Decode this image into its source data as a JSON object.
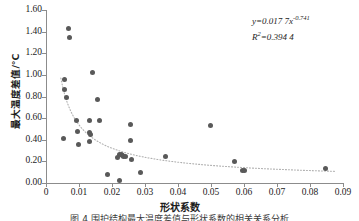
{
  "chart_data": {
    "type": "scatter",
    "title": "",
    "xlabel": "形状系数",
    "ylabel": "最大温度差值/°C",
    "xlim": [
      0,
      0.09
    ],
    "ylim": [
      0,
      1.6
    ],
    "xticks": [
      "0",
      "0.01",
      "0.02",
      "0.03",
      "0.04",
      "0.05",
      "0.06",
      "0.07",
      "0.08",
      "0.09"
    ],
    "xtick_values": [
      0,
      0.01,
      0.02,
      0.03,
      0.04,
      0.05,
      0.06,
      0.07,
      0.08,
      0.09
    ],
    "yticks": [
      "0.00",
      "0.20",
      "0.40",
      "0.60",
      "0.80",
      "1.00",
      "1.20",
      "1.40",
      "1.60"
    ],
    "ytick_values": [
      0,
      0.2,
      0.4,
      0.6,
      0.8,
      1.0,
      1.2,
      1.4,
      1.6
    ],
    "grid": false,
    "legend": "none",
    "marker_color": "#595959",
    "trendline_color": "#b0b0b0",
    "trendline_style": "dotted",
    "points": [
      [
        0.0068,
        1.425
      ],
      [
        0.007,
        1.345
      ],
      [
        0.0055,
        0.96
      ],
      [
        0.0057,
        0.868
      ],
      [
        0.0062,
        0.795
      ],
      [
        0.014,
        1.025
      ],
      [
        0.0155,
        0.775
      ],
      [
        0.0093,
        0.575
      ],
      [
        0.0133,
        0.575
      ],
      [
        0.0162,
        0.58
      ],
      [
        0.0096,
        0.472
      ],
      [
        0.0131,
        0.468
      ],
      [
        0.0136,
        0.452
      ],
      [
        0.0054,
        0.41
      ],
      [
        0.0098,
        0.355
      ],
      [
        0.0133,
        0.385
      ],
      [
        0.0255,
        0.538
      ],
      [
        0.0256,
        0.392
      ],
      [
        0.0497,
        0.528
      ],
      [
        0.0222,
        0.262
      ],
      [
        0.0228,
        0.268
      ],
      [
        0.0232,
        0.255
      ],
      [
        0.0236,
        0.248
      ],
      [
        0.024,
        0.245
      ],
      [
        0.0216,
        0.235
      ],
      [
        0.0259,
        0.215
      ],
      [
        0.0362,
        0.245
      ],
      [
        0.0572,
        0.195
      ],
      [
        0.0596,
        0.118
      ],
      [
        0.0601,
        0.112
      ],
      [
        0.0848,
        0.138
      ],
      [
        0.0185,
        0.082
      ],
      [
        0.0285,
        0.095
      ],
      [
        0.0222,
        0.025
      ]
    ],
    "fit": {
      "equation_y": "y",
      "equation_rest": "=0.017 7",
      "equation_x": "x",
      "equation_exp": "-0.741",
      "coefficient": 0.0177,
      "exponent": -0.741,
      "r2_label": "R",
      "r2_sup": "2",
      "r2_value": "=0.394 4",
      "r2": 0.3944
    }
  },
  "caption": "图 4 围护结构最大温度差值与形状系数的相关关系分析"
}
